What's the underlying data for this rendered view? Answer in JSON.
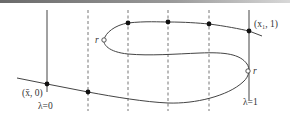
{
  "diagram": {
    "type": "homotopy-path-diagram",
    "labels": {
      "start_point": "(x̄, 0)",
      "end_point": "(x₁, 1)",
      "lambda_zero": "λ=0",
      "lambda_one": "λ=1",
      "turning_point_left": "r",
      "turning_point_right": "r"
    },
    "colors": {
      "line": "#444444",
      "dashed": "#777777",
      "dot": "#111111",
      "open_dot_fill": "#ffffff",
      "top_bar_start": "#6a6a6a",
      "top_bar_end": "#d8d8d8"
    },
    "vertical_lines": [
      {
        "name": "lambda-0",
        "x": 47,
        "style": "solid"
      },
      {
        "name": "dash-1",
        "x": 88,
        "style": "dashed"
      },
      {
        "name": "dash-2",
        "x": 128,
        "style": "dashed"
      },
      {
        "name": "dash-3",
        "x": 168,
        "style": "dashed"
      },
      {
        "name": "dash-4",
        "x": 209,
        "style": "dashed"
      },
      {
        "name": "lambda-1",
        "x": 249,
        "style": "solid"
      }
    ],
    "filled_points": [
      {
        "x": 47,
        "y": 84
      },
      {
        "x": 88,
        "y": 92
      },
      {
        "x": 128,
        "y": 23
      },
      {
        "x": 168,
        "y": 22
      },
      {
        "x": 209,
        "y": 24
      },
      {
        "x": 249,
        "y": 31
      }
    ],
    "open_points": [
      {
        "x": 104,
        "y": 40
      },
      {
        "x": 248,
        "y": 71
      }
    ]
  }
}
